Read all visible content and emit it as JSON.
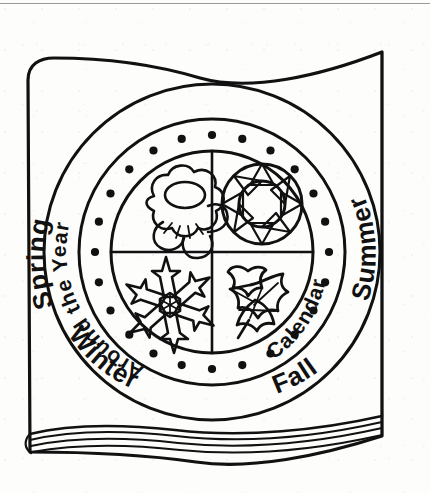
{
  "page": {
    "background_color": "#fdfdfc",
    "ink_color": "#111111",
    "rule_color": "#9a9a9a",
    "style": "black-and-white line art"
  },
  "book": {
    "name": "book-cover",
    "description": "Open-front hardcover book with wavy top edge and stacked page edges at the bottom"
  },
  "emblem": {
    "outer_ring_labels": [
      {
        "id": "spring",
        "text": "Spring",
        "position": "upper-left"
      },
      {
        "id": "summer",
        "text": "Summer",
        "position": "upper-right"
      },
      {
        "id": "fall",
        "text": "Fall",
        "position": "lower-right"
      },
      {
        "id": "winter",
        "text": "Winter",
        "position": "lower-left"
      }
    ],
    "inner_ring_labels": [
      {
        "id": "title-left",
        "text": "Around the Year",
        "position": "left-arc"
      },
      {
        "id": "title-right",
        "text": "Calendar",
        "position": "right-arc"
      }
    ],
    "dot_ring": {
      "count": 24,
      "shape": "dot"
    },
    "quadrants": [
      {
        "id": "spring-quadrant",
        "icon": "flower-icon",
        "season": "Spring",
        "position": "top-left"
      },
      {
        "id": "summer-quadrant",
        "icon": "sun-icon",
        "season": "Summer",
        "position": "top-right"
      },
      {
        "id": "winter-quadrant",
        "icon": "snowflake-icon",
        "season": "Winter",
        "position": "bottom-left"
      },
      {
        "id": "fall-quadrant",
        "icon": "maple-leaf-icon",
        "season": "Fall",
        "position": "bottom-right"
      }
    ]
  }
}
